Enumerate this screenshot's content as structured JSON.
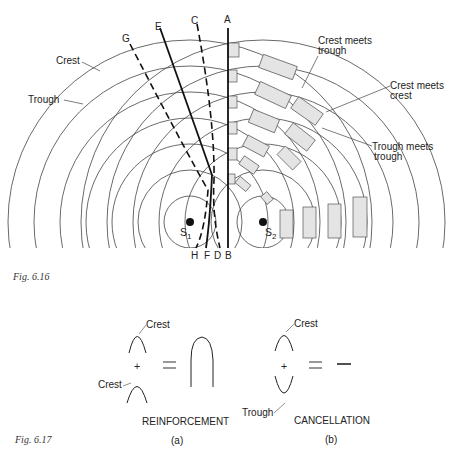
{
  "fig_6_16": {
    "caption": "Fig. 6.16",
    "labels": {
      "crest": "Crest",
      "trough": "Trough",
      "crest_meets_trough_1": "Crest meets",
      "crest_meets_trough_2": "trough",
      "crest_meets_crest_1": "Crest meets",
      "crest_meets_crest_2": "crest",
      "trough_meets_trough_1": "Trough meets",
      "trough_meets_trough_2": "trough"
    },
    "sources": [
      {
        "name": "S",
        "sub": "1"
      },
      {
        "name": "S",
        "sub": "2"
      }
    ],
    "top_line_labels": [
      "G",
      "E",
      "C",
      "A"
    ],
    "bottom_line_labels": [
      "H",
      "F",
      "D",
      "B"
    ]
  },
  "fig_6_17": {
    "caption": "Fig. 6.17",
    "panel_a": {
      "crest_top": "Crest",
      "crest_bottom": "Crest",
      "plus": "+",
      "equals": "=",
      "title": "REINFORCEMENT",
      "sub": "(a)"
    },
    "panel_b": {
      "crest": "Crest",
      "trough": "Trough",
      "plus": "+",
      "equals": "=",
      "result": "—",
      "title": "CANCELLATION",
      "sub": "(b)"
    }
  }
}
